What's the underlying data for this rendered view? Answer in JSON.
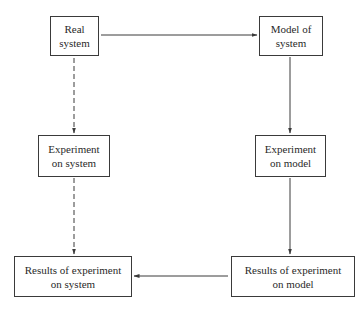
{
  "diagram": {
    "type": "flowchart",
    "nodes": {
      "real_system": {
        "line1": "Real",
        "line2": "system"
      },
      "model_of_system": {
        "line1": "Model of",
        "line2": "system"
      },
      "experiment_on_system": {
        "line1": "Experiment",
        "line2": "on system"
      },
      "experiment_on_model": {
        "line1": "Experiment",
        "line2": "on model"
      },
      "results_on_system": {
        "line1": "Results of experiment",
        "line2": "on system"
      },
      "results_on_model": {
        "line1": "Results of experiment",
        "line2": "on model"
      }
    },
    "edges": [
      {
        "from": "real_system",
        "to": "model_of_system",
        "style": "solid"
      },
      {
        "from": "real_system",
        "to": "experiment_on_system",
        "style": "dashed"
      },
      {
        "from": "experiment_on_system",
        "to": "results_on_system",
        "style": "dashed"
      },
      {
        "from": "model_of_system",
        "to": "experiment_on_model",
        "style": "solid"
      },
      {
        "from": "experiment_on_model",
        "to": "results_on_model",
        "style": "solid"
      },
      {
        "from": "results_on_model",
        "to": "results_on_system",
        "style": "solid"
      }
    ],
    "colors": {
      "line": "#3a3a3a",
      "text": "#2a2a2a",
      "background": "#ffffff"
    }
  }
}
